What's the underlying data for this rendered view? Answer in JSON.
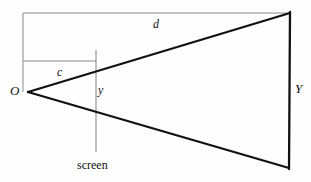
{
  "figure": {
    "background_color": "#fefefe",
    "stroke_color": "#111111",
    "thin_stroke_color": "#8a8a8a",
    "width": 311,
    "height": 182,
    "labels": {
      "origin": "O",
      "distance_to_screen": "c",
      "distance_to_object": "d",
      "image_height": "y",
      "object_height": "Y",
      "screen": "screen"
    },
    "geometry": {
      "apex": [
        28,
        92
      ],
      "top_right": [
        290,
        13
      ],
      "bottom_right": [
        289,
        168
      ],
      "screen_line_x": 96,
      "screen_line_top": 50,
      "screen_line_bottom": 152,
      "c_line_y": 61,
      "c_line_start_x": 23,
      "c_line_end_x": 96,
      "d_line_y": 13,
      "d_line_start_x": 23,
      "d_line_end_x": 290,
      "left_vertical_x": 23,
      "left_vertical_top": 13,
      "left_vertical_bottom": 92
    }
  }
}
